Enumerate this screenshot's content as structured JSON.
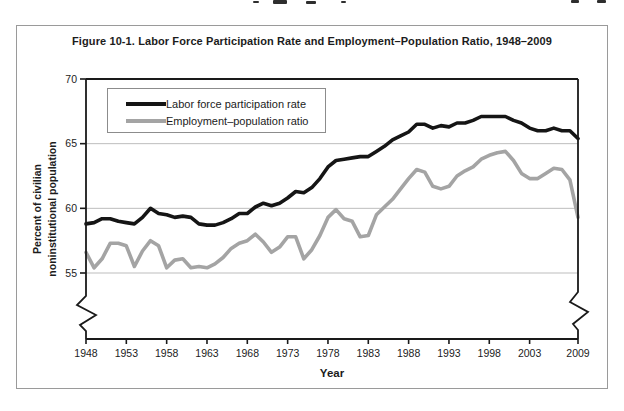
{
  "figure": {
    "title": "Figure 10-1. Labor Force Participation Rate and Employment–Population Ratio, 1948–2009"
  },
  "chart_data": {
    "type": "line",
    "title": "Figure 10-1. Labor Force Participation Rate and Employment–Population Ratio, 1948–2009",
    "xlabel": "Year",
    "ylabel_line1": "Percent of civilian",
    "ylabel_line2": "noninstitutional population",
    "x_range": [
      1948,
      2009
    ],
    "x_step": 1,
    "xticks": [
      1948,
      1953,
      1958,
      1963,
      1968,
      1973,
      1978,
      1983,
      1988,
      1993,
      1998,
      2003,
      2009
    ],
    "yticks": [
      70,
      65,
      60,
      55
    ],
    "ylim": [
      55,
      70
    ],
    "axis_break_below_ymin": true,
    "grid": true,
    "legend_position": "top-left",
    "colors": {
      "axis": "#1a1a1a",
      "gridline": "#bdbdbd",
      "tick_text": "#1c1c1c"
    },
    "series": [
      {
        "name": "Labor force participation rate",
        "color": "#151515",
        "values": [
          58.8,
          58.9,
          59.2,
          59.2,
          59.0,
          58.9,
          58.8,
          59.3,
          60.0,
          59.6,
          59.5,
          59.3,
          59.4,
          59.3,
          58.8,
          58.7,
          58.7,
          58.9,
          59.2,
          59.6,
          59.6,
          60.1,
          60.4,
          60.2,
          60.4,
          60.8,
          61.3,
          61.2,
          61.6,
          62.3,
          63.2,
          63.7,
          63.8,
          63.9,
          64.0,
          64.0,
          64.4,
          64.8,
          65.3,
          65.6,
          65.9,
          66.5,
          66.5,
          66.2,
          66.4,
          66.3,
          66.6,
          66.6,
          66.8,
          67.1,
          67.1,
          67.1,
          67.1,
          66.8,
          66.6,
          66.2,
          66.0,
          66.0,
          66.2,
          66.0,
          66.0,
          65.4
        ]
      },
      {
        "name": "Employment–population ratio",
        "color": "#a4a4a4",
        "values": [
          56.6,
          55.4,
          56.1,
          57.3,
          57.3,
          57.1,
          55.5,
          56.7,
          57.5,
          57.1,
          55.4,
          56.0,
          56.1,
          55.4,
          55.5,
          55.4,
          55.7,
          56.2,
          56.9,
          57.3,
          57.5,
          58.0,
          57.4,
          56.6,
          57.0,
          57.8,
          57.8,
          56.1,
          56.8,
          57.9,
          59.3,
          59.9,
          59.2,
          59.0,
          57.8,
          57.9,
          59.5,
          60.1,
          60.7,
          61.5,
          62.3,
          63.0,
          62.8,
          61.7,
          61.5,
          61.7,
          62.5,
          62.9,
          63.2,
          63.8,
          64.1,
          64.3,
          64.4,
          63.7,
          62.7,
          62.3,
          62.3,
          62.7,
          63.1,
          63.0,
          62.2,
          59.3
        ]
      }
    ]
  }
}
